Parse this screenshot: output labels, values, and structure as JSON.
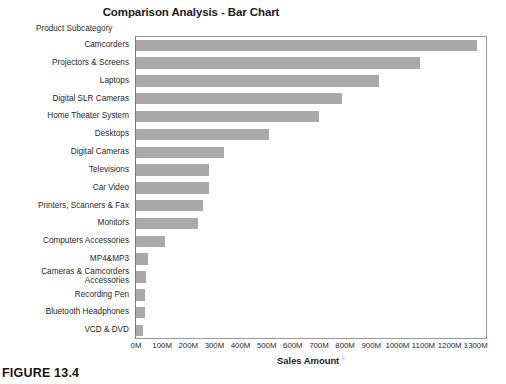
{
  "figure": {
    "caption": "FIGURE 13.4"
  },
  "chart_data": {
    "type": "bar",
    "orientation": "horizontal",
    "title": "Comparison Analysis - Bar Chart",
    "subtitle": "",
    "ylabel": "Product Subcategory",
    "xlabel": "Sales Amount",
    "xlabel_mark": "F",
    "grid": false,
    "legend": null,
    "bar_color": "#a9a9a9",
    "xlim": [
      0,
      1300
    ],
    "xunit": "M",
    "xticks": [
      0,
      100,
      200,
      300,
      400,
      500,
      600,
      700,
      800,
      900,
      1000,
      1100,
      1200,
      1300
    ],
    "xticklabels": [
      "0M",
      "100M",
      "200M",
      "300M",
      "400M",
      "500M",
      "600M",
      "700M",
      "800M",
      "900M",
      "1000M",
      "1100M",
      "1200M",
      "1300M"
    ],
    "categories": [
      "Camcorders",
      "Projectors & Screens",
      "Laptops",
      "Digital SLR Cameras",
      "Home Theater System",
      "Desktops",
      "Digital Cameras",
      "Televisions",
      "Car Video",
      "Printers, Scanners & Fax",
      "Monitors",
      "Computers Accessories",
      "MP4&MP3",
      "Cameras & Camcorders Accessories",
      "Recording Pen",
      "Bluetooth Headphones",
      "VCD & DVD"
    ],
    "values": [
      1305,
      1085,
      930,
      790,
      700,
      510,
      335,
      280,
      278,
      258,
      238,
      110,
      45,
      38,
      33,
      33,
      26
    ]
  }
}
